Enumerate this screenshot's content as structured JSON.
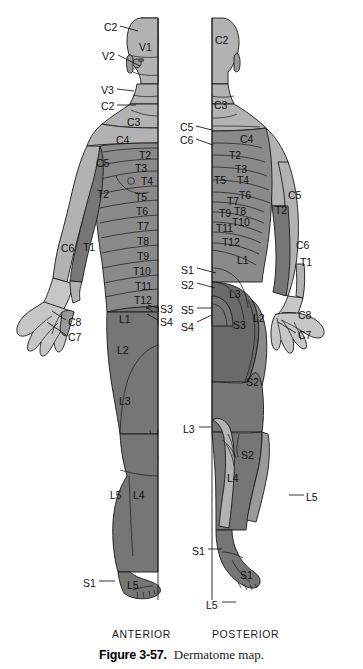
{
  "figure": {
    "number_label": "Figure 3-57.",
    "title": "Dermatome map.",
    "views": {
      "anterior": "ANTERIOR",
      "posterior": "POSTERIOR"
    }
  },
  "colors": {
    "background": "#ffffff",
    "outline": "#1a1a1a",
    "tone_light": "#c6c6c6",
    "tone_mid_light": "#b2b2b2",
    "tone_mid": "#9a9a9a",
    "tone_mid_dark": "#8a8a8a",
    "tone_dark": "#767676",
    "tone_darkest": "#6a6a6a",
    "text": "#111111"
  },
  "anterior": {
    "leader_labels": [
      {
        "text": "C2",
        "x": 104,
        "y": 22,
        "lx1": 120,
        "ly1": 26,
        "lx2": 138,
        "ly2": 31
      },
      {
        "text": "V2",
        "x": 102,
        "y": 51,
        "lx1": 118,
        "ly1": 55,
        "lx2": 140,
        "ly2": 66
      },
      {
        "text": "V3",
        "x": 101,
        "y": 85,
        "lx1": 117,
        "ly1": 89,
        "lx2": 134,
        "ly2": 91
      },
      {
        "text": "C2",
        "x": 101,
        "y": 101,
        "lx1": 117,
        "ly1": 105,
        "lx2": 136,
        "ly2": 105
      },
      {
        "text": "C8",
        "x": 68,
        "y": 317,
        "lx1": 66,
        "ly1": 320,
        "lx2": 52,
        "ly2": 311
      },
      {
        "text": "C7",
        "x": 68,
        "y": 332,
        "lx1": 66,
        "ly1": 335,
        "lx2": 47,
        "ly2": 322
      },
      {
        "text": "S3",
        "x": 160,
        "y": 304,
        "lx1": 158,
        "ly1": 308,
        "lx2": 148,
        "ly2": 305
      },
      {
        "text": "S4",
        "x": 160,
        "y": 317,
        "lx1": 158,
        "ly1": 320,
        "lx2": 147,
        "ly2": 314
      },
      {
        "text": "S1",
        "x": 83,
        "y": 578,
        "lx1": 99,
        "ly1": 581,
        "lx2": 115,
        "ly2": 581
      }
    ],
    "region_labels": [
      {
        "text": "V1",
        "x": 139,
        "y": 42
      },
      {
        "text": "C3",
        "x": 127,
        "y": 117
      },
      {
        "text": "C4",
        "x": 116,
        "y": 135
      },
      {
        "text": "C5",
        "x": 96,
        "y": 158
      },
      {
        "text": "T2",
        "x": 139,
        "y": 150
      },
      {
        "text": "T3",
        "x": 135,
        "y": 163
      },
      {
        "text": "T4",
        "x": 141,
        "y": 176
      },
      {
        "text": "T2",
        "x": 97,
        "y": 189
      },
      {
        "text": "T5",
        "x": 135,
        "y": 192
      },
      {
        "text": "T6",
        "x": 136,
        "y": 206
      },
      {
        "text": "T7",
        "x": 137,
        "y": 221
      },
      {
        "text": "T8",
        "x": 137,
        "y": 236
      },
      {
        "text": "C6",
        "x": 61,
        "y": 243
      },
      {
        "text": "T1",
        "x": 83,
        "y": 242
      },
      {
        "text": "T9",
        "x": 137,
        "y": 251
      },
      {
        "text": "T10",
        "x": 133,
        "y": 266
      },
      {
        "text": "T11",
        "x": 135,
        "y": 281
      },
      {
        "text": "T12",
        "x": 134,
        "y": 295
      },
      {
        "text": "L1",
        "x": 119,
        "y": 314
      },
      {
        "text": "L2",
        "x": 117,
        "y": 345
      },
      {
        "text": "L3",
        "x": 119,
        "y": 396
      },
      {
        "text": "L5",
        "x": 110,
        "y": 490
      },
      {
        "text": "L4",
        "x": 133,
        "y": 490
      },
      {
        "text": "L5",
        "x": 127,
        "y": 580
      }
    ]
  },
  "posterior": {
    "leader_labels": [
      {
        "text": "C5",
        "x": 180,
        "y": 122,
        "lx1": 196,
        "ly1": 126,
        "lx2": 212,
        "ly2": 130
      },
      {
        "text": "C6",
        "x": 180,
        "y": 135,
        "lx1": 196,
        "ly1": 139,
        "lx2": 213,
        "ly2": 145
      },
      {
        "text": "S1",
        "x": 181,
        "y": 265,
        "lx1": 197,
        "ly1": 268,
        "lx2": 216,
        "ly2": 273
      },
      {
        "text": "S2",
        "x": 181,
        "y": 280,
        "lx1": 197,
        "ly1": 283,
        "lx2": 215,
        "ly2": 288
      },
      {
        "text": "S5",
        "x": 181,
        "y": 305,
        "lx1": 197,
        "ly1": 308,
        "lx2": 213,
        "ly2": 308
      },
      {
        "text": "S4",
        "x": 181,
        "y": 322,
        "lx1": 197,
        "ly1": 322,
        "lx2": 212,
        "ly2": 315
      },
      {
        "text": "C8",
        "x": 298,
        "y": 310,
        "lx1": 296,
        "ly1": 313,
        "lx2": 282,
        "ly2": 313
      },
      {
        "text": "C7",
        "x": 298,
        "y": 330,
        "lx1": 296,
        "ly1": 333,
        "lx2": 278,
        "ly2": 322
      },
      {
        "text": "L3",
        "x": 183,
        "y": 424,
        "lx1": 199,
        "ly1": 427,
        "lx2": 211,
        "ly2": 427
      },
      {
        "text": "L5",
        "x": 306,
        "y": 492,
        "lx1": 304,
        "ly1": 495,
        "lx2": 289,
        "ly2": 495
      },
      {
        "text": "S1",
        "x": 192,
        "y": 546,
        "lx1": 208,
        "ly1": 549,
        "lx2": 222,
        "ly2": 549
      },
      {
        "text": "L5",
        "x": 206,
        "y": 600,
        "lx1": 222,
        "ly1": 602,
        "lx2": 236,
        "ly2": 602
      }
    ],
    "region_labels": [
      {
        "text": "C2",
        "x": 215,
        "y": 35
      },
      {
        "text": "C3",
        "x": 214,
        "y": 100
      },
      {
        "text": "C4",
        "x": 240,
        "y": 134
      },
      {
        "text": "T2",
        "x": 229,
        "y": 150
      },
      {
        "text": "T3",
        "x": 235,
        "y": 164
      },
      {
        "text": "T5",
        "x": 214,
        "y": 175
      },
      {
        "text": "T4",
        "x": 237,
        "y": 175
      },
      {
        "text": "C5",
        "x": 288,
        "y": 190
      },
      {
        "text": "T6",
        "x": 239,
        "y": 190
      },
      {
        "text": "T7",
        "x": 227,
        "y": 196
      },
      {
        "text": "T8",
        "x": 234,
        "y": 206
      },
      {
        "text": "T9",
        "x": 219,
        "y": 208
      },
      {
        "text": "T2",
        "x": 275,
        "y": 205
      },
      {
        "text": "T10",
        "x": 232,
        "y": 217
      },
      {
        "text": "T11",
        "x": 216,
        "y": 223
      },
      {
        "text": "C6",
        "x": 296,
        "y": 240
      },
      {
        "text": "T12",
        "x": 222,
        "y": 237
      },
      {
        "text": "T1",
        "x": 300,
        "y": 257
      },
      {
        "text": "L1",
        "x": 237,
        "y": 255
      },
      {
        "text": "L3",
        "x": 229,
        "y": 289
      },
      {
        "text": "L2",
        "x": 253,
        "y": 313
      },
      {
        "text": "S3",
        "x": 233,
        "y": 320
      },
      {
        "text": "S2",
        "x": 246,
        "y": 377
      },
      {
        "text": "S2",
        "x": 241,
        "y": 450
      },
      {
        "text": "L4",
        "x": 227,
        "y": 473
      },
      {
        "text": "S1",
        "x": 240,
        "y": 570
      }
    ]
  }
}
